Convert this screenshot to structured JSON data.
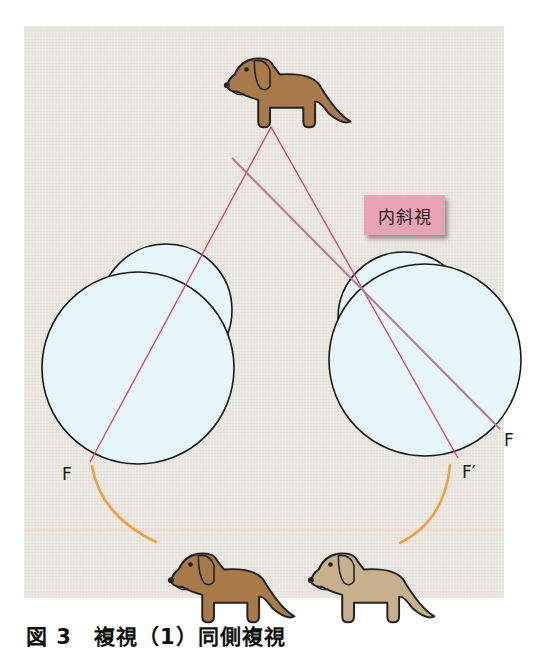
{
  "figure": {
    "label_box": "内斜視",
    "labels": {
      "left_fovea": "F",
      "right_fovea": "F",
      "right_false_fovea": "F′"
    },
    "caption": "図 3　複視（1）同側複視"
  },
  "colors": {
    "background": "#e9e6df",
    "eye_fill": "#e6f6fb",
    "ray_red": "#d84a6a",
    "ray_mauve": "#b9788f",
    "arc_orange": "#f0a040",
    "dog_real": "#a87a4a",
    "dog_ghost": "#c7b08e",
    "label_bg": "#e8a3b4"
  },
  "elements": {
    "object_dog": "real dog (target object)",
    "left_eye": "left eyeball",
    "right_eye": "right eyeball (esotropic)",
    "image_dog_real": "perceived real dog",
    "image_dog_ghost": "perceived ghost dog"
  }
}
